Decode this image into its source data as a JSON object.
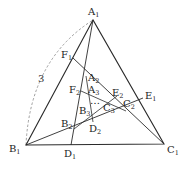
{
  "diagram": {
    "arc_label": "3",
    "ellipsis": "…",
    "colors": {
      "line": "#2a2a2a",
      "arc": "#888888",
      "background": "#ffffff"
    },
    "points": {
      "A1": {
        "base": "A",
        "sub": "1"
      },
      "B1": {
        "base": "B",
        "sub": "1"
      },
      "C1": {
        "base": "C",
        "sub": "1"
      },
      "D1": {
        "base": "D",
        "sub": "1"
      },
      "E1": {
        "base": "E",
        "sub": "1"
      },
      "F1": {
        "base": "F",
        "sub": "1"
      },
      "A2": {
        "base": "A",
        "sub": "2"
      },
      "B2": {
        "base": "B",
        "sub": "2"
      },
      "C2": {
        "base": "C",
        "sub": "2"
      },
      "D2": {
        "base": "D",
        "sub": "2"
      },
      "E2": {
        "base": "E",
        "sub": "2"
      },
      "F2": {
        "base": "F",
        "sub": "2"
      },
      "A3": {
        "base": "A",
        "sub": "3"
      },
      "B3": {
        "base": "B",
        "sub": "3"
      },
      "C3": {
        "base": "C",
        "sub": "3"
      }
    }
  }
}
